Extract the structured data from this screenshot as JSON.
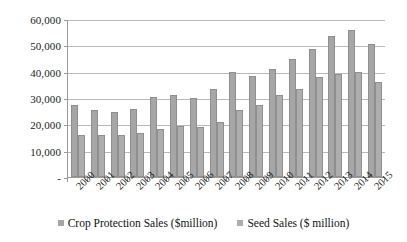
{
  "chart_data": {
    "type": "bar",
    "title": "",
    "xlabel": "",
    "ylabel": "",
    "ylim": [
      0,
      60000
    ],
    "grid": true,
    "legend_position": "bottom",
    "ytick_labels": [
      "60,000",
      "50,000",
      "40,000",
      "30,000",
      "20,000",
      "10,000",
      "-"
    ],
    "ytick_values": [
      60000,
      50000,
      40000,
      30000,
      20000,
      10000,
      0
    ],
    "categories": [
      "2000",
      "2001",
      "2002",
      "2003",
      "2004",
      "2005",
      "2006",
      "2007",
      "2008",
      "2009",
      "2010",
      "2011",
      "2012",
      "2013",
      "2014",
      "2015"
    ],
    "series": [
      {
        "name": "Crop Protection Sales ($million)",
        "color": "#a6a6a6",
        "values": [
          27500,
          25500,
          24500,
          26000,
          30500,
          31000,
          30000,
          33500,
          40000,
          38500,
          41000,
          45000,
          48500,
          53500,
          56000,
          50500
        ]
      },
      {
        "name": "Seed Sales ($ million)",
        "color": "#adadad",
        "values": [
          16000,
          16000,
          15800,
          16800,
          18200,
          19200,
          19000,
          21000,
          25500,
          27500,
          31000,
          33500,
          38000,
          39000,
          40000,
          36000
        ]
      }
    ]
  },
  "legend": {
    "items": [
      {
        "label": "Crop Protection Sales ($million)",
        "color": "#a6a6a6"
      },
      {
        "label": "Seed Sales ($ million)",
        "color": "#adadad"
      }
    ]
  }
}
